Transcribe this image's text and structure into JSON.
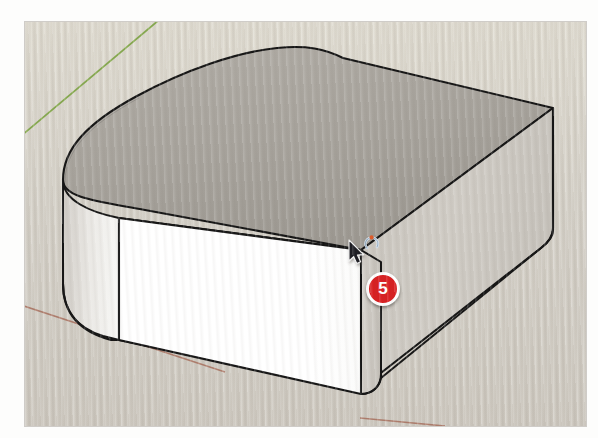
{
  "app": {
    "name": "SketchUp",
    "view_mode": "3D perspective viewport",
    "figure_caption": ""
  },
  "viewport": {
    "background_color": "#d6d2c9",
    "frame": {
      "x": 25,
      "y": 22,
      "width": 561,
      "height": 404
    }
  },
  "axes": [
    {
      "name": "green-axis",
      "color": "#7aa340",
      "label": "green axis",
      "x1": 0,
      "y1": 112,
      "x2": 132,
      "y2": 0
    },
    {
      "name": "red-axis",
      "color": "#a9705f",
      "label": "red axis",
      "x1": 0,
      "y1": 284,
      "x2": 360,
      "y2": 404
    }
  ],
  "model": {
    "name": "rounded-box",
    "description": "Rectangular box with filleted (rounded) vertical corners",
    "faces": [
      {
        "name": "top-face",
        "color": "#a6a29c",
        "highlight": "#b2aea7"
      },
      {
        "name": "front-face",
        "color": "#ffffff",
        "shade": "#f2f1ee"
      },
      {
        "name": "right-face",
        "color": "#cdc9c2",
        "shade": "#c2beb7"
      },
      {
        "name": "left-fillet",
        "color": "#e8e6e2"
      },
      {
        "name": "right-fillet",
        "color": "#c8c4be"
      }
    ],
    "edge_color": "#1a1a1a",
    "edge_width": 2
  },
  "cursor": {
    "name": "select-tool-cursor",
    "tool": "Select",
    "icon": "arrow-pointer",
    "x": 352,
    "y": 245,
    "badge_icon": "rotate-hint-icon"
  },
  "callout": {
    "label": "5",
    "color": "#d81f21",
    "text_color": "#ffffff",
    "x": 366,
    "y": 272,
    "name": "step-callout-5"
  }
}
